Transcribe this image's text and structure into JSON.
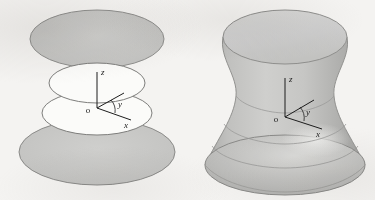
{
  "figure": {
    "kind": "math-textbook-illustration",
    "background_color": "#f4f3f1"
  },
  "panels": [
    {
      "id": "left",
      "name": "cross-sections-panel",
      "axes": {
        "origin_label": "o",
        "z_label": "z",
        "y_label": "y",
        "x_label": "x",
        "stroke_color": "#1d1d1d"
      },
      "cross_sections": [
        {
          "name": "top-disc",
          "filled": true,
          "fill_color": "#c9c9c7",
          "stroke_color": "#8f8f8d",
          "cx": 97,
          "cy": 39,
          "rx": 67,
          "ry": 29
        },
        {
          "name": "upper-waist-ring",
          "filled": false,
          "fill_color": "#ffffff",
          "stroke_color": "#7e7e7c",
          "cx": 97,
          "cy": 83,
          "rx": 48,
          "ry": 20
        },
        {
          "name": "lower-waist-ring",
          "filled": false,
          "fill_color": "#ffffff",
          "stroke_color": "#7e7e7c",
          "cx": 97,
          "cy": 113,
          "rx": 55,
          "ry": 22
        },
        {
          "name": "bottom-disc",
          "filled": true,
          "fill_color": "#c4c4c2",
          "stroke_color": "#8a8a88",
          "cx": 97,
          "cy": 152,
          "rx": 78,
          "ry": 33
        }
      ]
    },
    {
      "id": "right",
      "name": "hyperboloid-surface-panel",
      "axes": {
        "origin_label": "o",
        "z_label": "z",
        "y_label": "y",
        "x_label": "x",
        "stroke_color": "#1d1d1d"
      },
      "surface": {
        "name": "hyperboloid-of-one-sheet",
        "top_rim": {
          "cx": 285,
          "cy": 37,
          "rx": 62,
          "ry": 27
        },
        "waist": {
          "cy": 95,
          "rx": 49
        },
        "bottom_rim": {
          "cx": 285,
          "cy": 165,
          "rx": 80,
          "ry": 30
        },
        "fill_light": "#d2d2d0",
        "fill_mid": "#b9b9b7",
        "fill_dark": "#a6a6a4",
        "stroke_color": "#8a8a88",
        "highlight_color": "#e8e8e6"
      },
      "latitude_lines": [
        {
          "name": "latitude-waist",
          "cy": 96,
          "rx": 49
        },
        {
          "name": "latitude-lower-mid",
          "cy": 124,
          "rx": 62
        },
        {
          "name": "latitude-lower",
          "cy": 143,
          "rx": 73
        }
      ]
    }
  ]
}
